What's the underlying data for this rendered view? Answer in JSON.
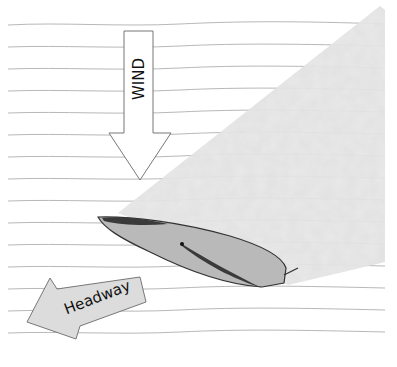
{
  "diagram": {
    "type": "sailing-wind-shadow",
    "labels": {
      "wind": "WIND",
      "headway": "Headway"
    },
    "elements": [
      {
        "id": "wind-arrow",
        "kind": "arrow",
        "direction": "down",
        "label": "WIND"
      },
      {
        "id": "headway-arrow",
        "kind": "arrow",
        "direction": "down-left",
        "label": "Headway"
      },
      {
        "id": "boat-hull",
        "kind": "shape",
        "description": "sailboat hull viewed from above with sail"
      },
      {
        "id": "wind-shadow",
        "kind": "region",
        "description": "textured gray wind shadow extending to upper right"
      },
      {
        "id": "water-lines",
        "kind": "lines",
        "count": 15
      }
    ],
    "colors": {
      "background": "#ffffff",
      "water_line": "#b8b8b8",
      "wind_shadow": "#e2e2e2",
      "hull_fill": "#b9b9b9",
      "hull_stroke": "#333333",
      "sail_dark": "#3a3a3a",
      "arrow_fill_wind": "#ffffff",
      "arrow_fill_headway": "#dcdcdc",
      "arrow_stroke": "#777777"
    }
  }
}
